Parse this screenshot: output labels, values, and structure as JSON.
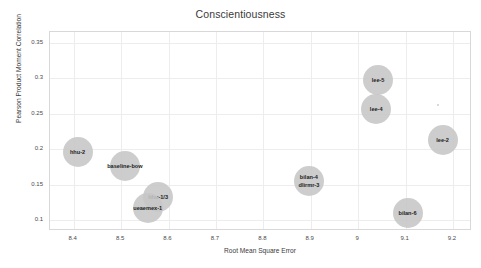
{
  "chart_data": {
    "type": "scatter",
    "title": "Conscientiousness",
    "xlabel": "Root Mean Square Error",
    "ylabel": "Pearson Product Moment Correlation",
    "xlim": [
      8.35,
      9.24
    ],
    "ylim": [
      0.085,
      0.365
    ],
    "xticks": [
      "8.4",
      "8.5",
      "8.6",
      "8.7",
      "8.8",
      "8.9",
      "9",
      "9.1",
      "9.2"
    ],
    "xtick_values": [
      8.4,
      8.5,
      8.6,
      8.7,
      8.8,
      8.9,
      9.0,
      9.1,
      9.2
    ],
    "yticks": [
      "0.35",
      "0.3",
      "0.25",
      "0.2",
      "0.15",
      "0.1"
    ],
    "ytick_values": [
      0.35,
      0.3,
      0.25,
      0.2,
      0.15,
      0.1
    ],
    "grid": true,
    "legend": "none",
    "marker_color": "#c6c6c6",
    "points": [
      {
        "label": "hhu-2",
        "x": 8.408,
        "y": 0.196,
        "size": 30
      },
      {
        "label": "baseline-bow",
        "x": 8.508,
        "y": 0.177,
        "size": 30
      },
      {
        "label": "hhu-1/3",
        "x": 8.578,
        "y": 0.133,
        "size": 30
      },
      {
        "label": "ueaemex-1",
        "x": 8.556,
        "y": 0.118,
        "size": 30
      },
      {
        "label": "bilan-4\ndlirmr-3",
        "x": 8.896,
        "y": 0.155,
        "size": 30
      },
      {
        "label": "lee-5",
        "x": 9.042,
        "y": 0.297,
        "size": 30
      },
      {
        "label": "lee-4",
        "x": 9.038,
        "y": 0.256,
        "size": 30
      },
      {
        "label": "lee-2",
        "x": 9.178,
        "y": 0.213,
        "size": 30
      },
      {
        "label": "bilan-6",
        "x": 9.104,
        "y": 0.11,
        "size": 30
      },
      {
        "label": "",
        "x": 9.168,
        "y": 0.262,
        "size": 2
      }
    ]
  }
}
